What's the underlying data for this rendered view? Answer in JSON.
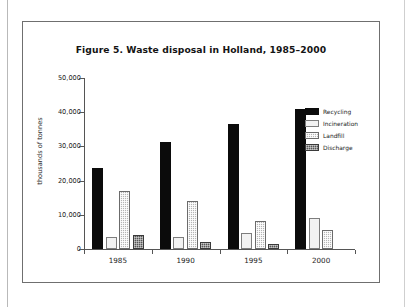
{
  "figure": {
    "title": "Figure 5. Waste disposal in Holland, 1985–2000"
  },
  "chart_data": {
    "type": "bar",
    "title": "Figure 5. Waste disposal in Holland, 1985–2000",
    "xlabel": "",
    "ylabel": "thousands of tonnes",
    "categories": [
      "1985",
      "1990",
      "1995",
      "2000"
    ],
    "ylim": [
      0,
      50000
    ],
    "yticks": [
      0,
      10000,
      20000,
      30000,
      40000,
      50000
    ],
    "ytick_labels": [
      "0",
      "10,000",
      "20,000",
      "30,000",
      "40,000",
      "50,000"
    ],
    "grid": false,
    "legend_position": "top-right",
    "series": [
      {
        "name": "Recycling",
        "color": "#0b0b0b",
        "fill": "solid-black",
        "values": [
          23800,
          31400,
          36500,
          40800
        ]
      },
      {
        "name": "Incineration",
        "color": "#f2f2f2",
        "fill": "white-outlined",
        "values": [
          3500,
          3500,
          4600,
          9100
        ]
      },
      {
        "name": "Landfill",
        "color": "#b5b5b5",
        "fill": "light-gray-dotted",
        "values": [
          16900,
          14100,
          8200,
          5500
        ]
      },
      {
        "name": "Discharge",
        "color": "#565656",
        "fill": "dark-gray-textured",
        "values": [
          4000,
          2000,
          1500,
          0
        ]
      }
    ]
  }
}
